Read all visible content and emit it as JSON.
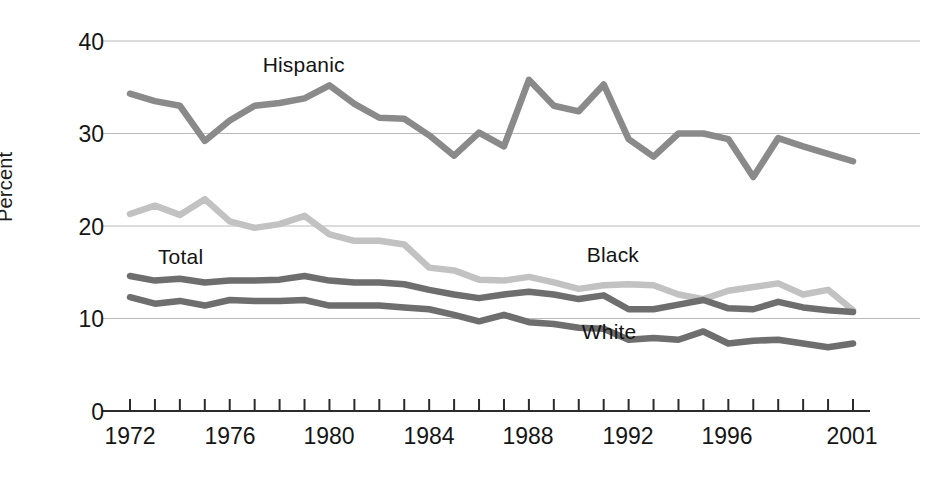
{
  "chart_data": {
    "type": "line",
    "title": "",
    "subtitle": "",
    "xlabel": "",
    "ylabel": "Percent",
    "xlim": [
      1972,
      2001
    ],
    "ylim": [
      0,
      40
    ],
    "yticks": [
      0,
      10,
      20,
      30,
      40
    ],
    "ytick_labels": [
      "0",
      "10",
      "20",
      "30",
      "40"
    ],
    "xticks": [
      1972,
      1973,
      1974,
      1975,
      1976,
      1977,
      1978,
      1979,
      1980,
      1981,
      1982,
      1983,
      1984,
      1985,
      1986,
      1987,
      1988,
      1989,
      1990,
      1991,
      1992,
      1993,
      1994,
      1995,
      1996,
      1997,
      1998,
      1999,
      2000,
      2001
    ],
    "xtick_labels": [
      "1972",
      "1976",
      "1980",
      "1984",
      "1988",
      "1992",
      "1996",
      "2001"
    ],
    "xtick_labeled_years": [
      1972,
      1976,
      1980,
      1984,
      1988,
      1992,
      1996,
      2001
    ],
    "grid": "horizontal",
    "legend_position": "inline-annotations",
    "x": [
      1972,
      1973,
      1974,
      1975,
      1976,
      1977,
      1978,
      1979,
      1980,
      1981,
      1982,
      1983,
      1984,
      1985,
      1986,
      1987,
      1988,
      1989,
      1990,
      1991,
      1992,
      1993,
      1994,
      1995,
      1996,
      1997,
      1998,
      1999,
      2000,
      2001
    ],
    "series": [
      {
        "name": "Hispanic",
        "color": "#8a8a8a",
        "label_x": 1977.4,
        "label_y": 37.2,
        "values": [
          34.3,
          33.5,
          33.0,
          29.2,
          31.4,
          33.0,
          33.3,
          33.8,
          35.2,
          33.2,
          31.7,
          31.6,
          29.8,
          27.6,
          30.1,
          28.6,
          35.8,
          33.0,
          32.4,
          35.3,
          29.4,
          27.5,
          30.0,
          30.0,
          29.4,
          25.3,
          29.5,
          28.6,
          27.8,
          27.0
        ]
      },
      {
        "name": "Black",
        "color": "#c2c2c2",
        "label_x": 1990.4,
        "label_y": 16.6,
        "values": [
          21.3,
          22.2,
          21.2,
          22.9,
          20.5,
          19.8,
          20.2,
          21.1,
          19.1,
          18.4,
          18.4,
          18.0,
          15.5,
          15.2,
          14.2,
          14.1,
          14.5,
          13.9,
          13.2,
          13.6,
          13.7,
          13.6,
          12.6,
          12.1,
          13.0,
          13.4,
          13.8,
          12.6,
          13.1,
          10.9
        ]
      },
      {
        "name": "Total",
        "color": "#6e6e6e",
        "label_x": 1973.2,
        "label_y": 16.4,
        "values": [
          14.6,
          14.1,
          14.3,
          13.9,
          14.1,
          14.1,
          14.2,
          14.6,
          14.1,
          13.9,
          13.9,
          13.7,
          13.1,
          12.6,
          12.2,
          12.6,
          12.9,
          12.6,
          12.1,
          12.5,
          11.0,
          11.0,
          11.5,
          12.0,
          11.1,
          11.0,
          11.8,
          11.2,
          10.9,
          10.7
        ]
      },
      {
        "name": "White",
        "color": "#6e6e6e",
        "label_x": 1990.2,
        "label_y": 8.3,
        "values": [
          12.3,
          11.6,
          11.9,
          11.4,
          12.0,
          11.9,
          11.9,
          12.0,
          11.4,
          11.4,
          11.4,
          11.2,
          11.0,
          10.4,
          9.7,
          10.4,
          9.6,
          9.4,
          9.0,
          8.9,
          7.7,
          7.9,
          7.7,
          8.6,
          7.3,
          7.6,
          7.7,
          7.3,
          6.9,
          7.3
        ]
      }
    ]
  },
  "axis": {
    "y_title": "Percent",
    "y_tick_40": "40",
    "y_tick_30": "30",
    "y_tick_20": "20",
    "y_tick_10": "10",
    "y_tick_0": "0",
    "x_tick_1972": "1972",
    "x_tick_1976": "1976",
    "x_tick_1980": "1980",
    "x_tick_1984": "1984",
    "x_tick_1988": "1988",
    "x_tick_1992": "1992",
    "x_tick_1996": "1996",
    "x_tick_2001": "2001"
  },
  "annotations": {
    "hispanic": "Hispanic",
    "black": "Black",
    "total": "Total",
    "white": "White"
  },
  "colors": {
    "hispanic": "#8a8a8a",
    "black": "#c2c2c2",
    "total": "#6e6e6e",
    "white": "#6e6e6e",
    "gridline": "#b9b9b9",
    "axis": "#2b2b2b",
    "text": "#161616"
  }
}
